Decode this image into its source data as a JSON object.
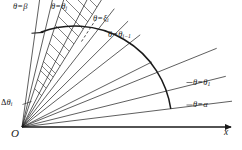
{
  "figure": {
    "kind": "polar-sector-partition-diagram",
    "background_color": "#ffffff",
    "line_color": "#1a1a1a",
    "axes": {
      "origin_label": "O",
      "x_axis_label": "x"
    },
    "labels": {
      "beta": {
        "theta": "θ",
        "eq": "=",
        "value": "β",
        "sub": ""
      },
      "theta_j": {
        "theta": "θ",
        "eq": "=",
        "value": "θ",
        "sub": "j"
      },
      "xi_i": {
        "theta": "θ",
        "eq": "=",
        "value": "ξ",
        "sub": "i"
      },
      "theta_i_minus_1": {
        "theta": "θ",
        "eq": "=",
        "value": "θ",
        "sub": "i−1"
      },
      "theta_1": {
        "theta": "θ",
        "eq": "=",
        "value": "θ",
        "sub": "1"
      },
      "alpha": {
        "theta": "θ",
        "eq": "=",
        "value": "α",
        "sub": ""
      },
      "delta_theta_i": {
        "delta": "Δ",
        "theta": "θ",
        "sub": "i"
      }
    },
    "geometry": {
      "origin": [
        22,
        127
      ],
      "arc_radius": 150,
      "angle_alpha_deg": 7,
      "angle_beta_deg": 76,
      "ray_angles_deg": [
        7,
        14,
        22,
        30,
        38,
        45,
        52,
        58,
        63,
        68,
        72,
        76
      ],
      "hatched_wedge": {
        "from_deg": 58,
        "to_deg": 72
      },
      "x_axis_end": [
        232,
        127
      ]
    }
  }
}
